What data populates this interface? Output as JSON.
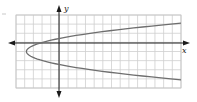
{
  "chart_data": {
    "type": "line",
    "title": "",
    "xlabel": "x",
    "ylabel": "y",
    "grid": true,
    "xlim": [
      -5,
      14
    ],
    "ylim": [
      -5,
      3
    ],
    "series": [
      {
        "name": "parabola",
        "equation": "x = a(y + 1)^2 - 3.8",
        "vertex": [
          -3.8,
          -1
        ],
        "points": [
          {
            "x": 14,
            "y": 2.1
          },
          {
            "x": 8,
            "y": 1.5
          },
          {
            "x": 3,
            "y": 0.9
          },
          {
            "x": 0,
            "y": 0.45
          },
          {
            "x": -2,
            "y": -0.1
          },
          {
            "x": -3.8,
            "y": -1
          },
          {
            "x": -2,
            "y": -1.9
          },
          {
            "x": 0,
            "y": -2.45
          },
          {
            "x": 3,
            "y": -2.9
          },
          {
            "x": 8,
            "y": -3.5
          },
          {
            "x": 14,
            "y": -4.1
          }
        ]
      }
    ]
  },
  "labels": {
    "x": "x",
    "y": "y"
  },
  "colors": {
    "grid": "#cfcfcf",
    "axis": "#1a1a1a",
    "curve": "#6e6e6e"
  }
}
